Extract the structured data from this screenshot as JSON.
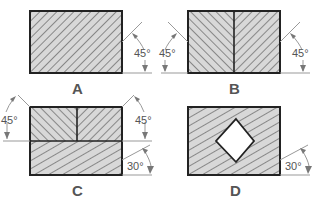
{
  "figure": {
    "background": "#ffffff",
    "hatch_fill": "#d8d8d8",
    "hatch_line": "#444444",
    "outline": "#222222",
    "text_color": "#555555",
    "panels": [
      {
        "id": "A",
        "label": "A",
        "description": "single rectangle, uniform 45° hatching",
        "hatch_angles": [
          45
        ],
        "angles": [
          {
            "text": "45°",
            "side": "right"
          }
        ]
      },
      {
        "id": "B",
        "label": "B",
        "description": "rectangle split vertically into two halves with opposite 45° hatching",
        "hatch_angles": [
          135,
          45
        ],
        "angles": [
          {
            "text": "45°",
            "side": "left"
          },
          {
            "text": "45°",
            "side": "right"
          }
        ]
      },
      {
        "id": "C",
        "label": "C",
        "description": "top half split into two opposite 45° hatched parts, bottom half hatched at 30°",
        "hatch_angles": [
          135,
          45,
          30
        ],
        "angles": [
          {
            "text": "45°",
            "side": "left-top"
          },
          {
            "text": "45°",
            "side": "right-top"
          },
          {
            "text": "30°",
            "side": "right-bottom"
          }
        ]
      },
      {
        "id": "D",
        "label": "D",
        "description": "rectangle hatched at 30° with an unhatched diamond-shaped hole",
        "hatch_angles": [
          30
        ],
        "angles": [
          {
            "text": "30°",
            "side": "right"
          }
        ]
      }
    ]
  }
}
